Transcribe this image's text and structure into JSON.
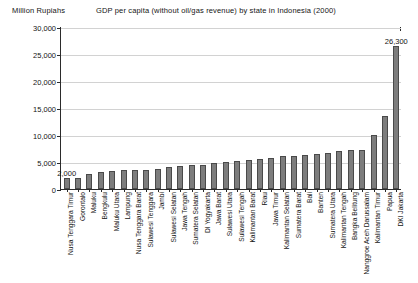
{
  "header": {
    "yaxis_title": "Million Rupiahs",
    "chart_title": "GDP per capita (without oil/gas revenue) by state in Indonesia (2000)"
  },
  "chart_data": {
    "type": "bar",
    "title": "GDP per capita (without oil/gas revenue) by state in Indonesia (2000)",
    "xlabel": "",
    "ylabel": "Million Rupiahs",
    "ylim": [
      0,
      30000
    ],
    "yticks": [
      0,
      5000,
      10000,
      15000,
      20000,
      25000,
      30000
    ],
    "ytick_labels": [
      "0",
      "5,000",
      "10,000",
      "15,000",
      "20,000",
      "25,000",
      "30,000"
    ],
    "grid": true,
    "legend": false,
    "bar_color": "#7d7d7d",
    "bar_edge_color": "#4a4a4a",
    "categories": [
      "Nusa Tenggara Timur",
      "Gorontalo",
      "Maluku",
      "Bengkulu",
      "Maluku Utara",
      "Lampung",
      "Nusa Tenggara Barat",
      "Sulawesi Tenggara",
      "Jambi",
      "Sulawesi Selatan",
      "Jawa Tengah",
      "Sumatera Selatan",
      "DI Yogyakarta",
      "Jawa Barat",
      "Sulawesi Utara",
      "Sulawesi Tengah",
      "Kalimantan Barat",
      "Riau",
      "Jawa Timur",
      "Kalimantan Selatan",
      "Sumatera Barat",
      "Bali",
      "Banten",
      "Sumatera Utara",
      "Kalimantan Tengah",
      "Bangka Belitung",
      "Nanggroe Aceh Darussalam",
      "Kalimantan Timur",
      "Papua",
      "DKI Jakarta"
    ],
    "values": [
      2000,
      2000,
      2600,
      3000,
      3200,
      3400,
      3500,
      3500,
      3600,
      3900,
      4100,
      4300,
      4400,
      4700,
      5000,
      5100,
      5200,
      5500,
      5700,
      6000,
      6100,
      6200,
      6300,
      6600,
      6900,
      7100,
      7200,
      10000,
      13500,
      26300
    ],
    "annotations": [
      {
        "category": "Nusa Tenggara Timur",
        "text": "2,000"
      },
      {
        "category": "DKI Jakarta",
        "text": "26,300"
      }
    ]
  }
}
